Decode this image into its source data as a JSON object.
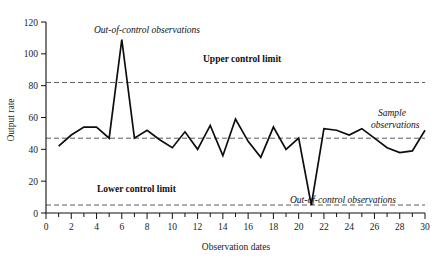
{
  "chart_data": {
    "type": "line",
    "title": "",
    "xlabel": "Observation dates",
    "ylabel": "Output rate",
    "xlim": [
      0,
      30
    ],
    "ylim": [
      0,
      120
    ],
    "grid": false,
    "legend": "none",
    "x": [
      1,
      2,
      3,
      4,
      5,
      6,
      7,
      8,
      9,
      10,
      11,
      12,
      13,
      14,
      15,
      16,
      17,
      18,
      19,
      20,
      21,
      22,
      23,
      24,
      25,
      26,
      27,
      28,
      29,
      30
    ],
    "values": [
      42,
      49,
      54,
      54,
      47,
      109,
      47,
      52,
      46,
      41,
      51,
      40,
      55,
      36,
      59,
      45,
      35,
      54,
      40,
      47,
      5,
      53,
      52,
      49,
      53,
      47,
      41,
      38,
      39,
      52
    ],
    "series": [
      {
        "name": "Sample observations",
        "values": [
          42,
          49,
          54,
          54,
          47,
          109,
          47,
          52,
          46,
          41,
          51,
          40,
          55,
          36,
          59,
          45,
          35,
          54,
          40,
          47,
          5,
          53,
          52,
          49,
          53,
          47,
          41,
          38,
          39,
          52
        ]
      }
    ],
    "y_ticks": [
      0,
      20,
      40,
      60,
      80,
      100,
      120
    ],
    "x_ticks": [
      0,
      2,
      4,
      6,
      8,
      10,
      12,
      14,
      16,
      18,
      20,
      22,
      24,
      26,
      28,
      30
    ],
    "x_minor_ticks": [
      1,
      3,
      5,
      7,
      9,
      11,
      13,
      15,
      17,
      19,
      21,
      23,
      25,
      27,
      29
    ],
    "reference_lines": [
      {
        "name": "upper-control-limit",
        "label": "Upper control limit",
        "value": 82
      },
      {
        "name": "center-line",
        "label": "",
        "value": 47
      },
      {
        "name": "lower-control-limit",
        "label": "Lower control limit",
        "value": 5
      }
    ],
    "annotations": [
      {
        "name": "out-of-control-high",
        "text": "Out-of-control observations",
        "at_x": 6,
        "at_y": 109
      },
      {
        "name": "out-of-control-low",
        "text": "Out-of-control observations",
        "at_x": 21,
        "at_y": 5
      },
      {
        "name": "sample-observations",
        "text_line1": "Sample",
        "text_line2": "observations",
        "at_x": 30,
        "at_y": 52
      }
    ]
  },
  "axis": {
    "y_label": "Output rate",
    "x_label": "Observation dates",
    "y_tick_labels": [
      "0",
      "20",
      "40",
      "60",
      "80",
      "100",
      "120"
    ],
    "x_tick_labels": [
      "0",
      "2",
      "4",
      "6",
      "8",
      "10",
      "12",
      "14",
      "16",
      "18",
      "20",
      "22",
      "24",
      "26",
      "28",
      "30"
    ]
  },
  "labels": {
    "upper_control_limit": "Upper control limit",
    "lower_control_limit": "Lower control limit",
    "out_of_control_top": "Out-of-control observations",
    "out_of_control_bottom": "Out-of-control observations",
    "sample_observations_line1": "Sample",
    "sample_observations_line2": "observations"
  },
  "colors": {
    "line": "#0d0d0d",
    "limit": "#4a4a4a",
    "axis": "#111111",
    "background": "#ffffff"
  }
}
